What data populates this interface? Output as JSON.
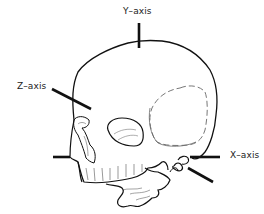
{
  "diagram": {
    "labels": {
      "y_axis": "Y–axis",
      "z_axis": "Z–axis",
      "x_axis": "X–axis"
    },
    "colors": {
      "stroke": "#111111",
      "dashed": "#777777",
      "thin": "#555555",
      "background": "#ffffff"
    }
  }
}
